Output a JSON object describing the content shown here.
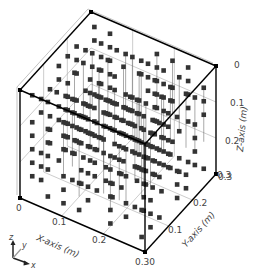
{
  "chart_data": {
    "type": "scatter",
    "projection": "3d",
    "title": "",
    "xlabel": "X-axis (m)",
    "ylabel": "Y-axis (m)",
    "zlabel": "Z-axis (m)",
    "xlim": [
      0,
      0.3
    ],
    "ylim": [
      0,
      0.3
    ],
    "zlim": [
      0,
      0.3
    ],
    "z_inverted": true,
    "x_ticks": [
      "0",
      "0.1",
      "0.2",
      "0.30"
    ],
    "y_ticks": [
      "0.1",
      "0.2",
      "0.3"
    ],
    "z_ticks": [
      "0",
      "0.1",
      "0.2",
      "0.3"
    ],
    "grid": true,
    "marker": "square",
    "marker_color": "#333333",
    "grid_spacing": 0.03
  },
  "triad": {
    "x": "x",
    "y": "y",
    "z": "z"
  },
  "colors": {
    "box_edge": "#000000",
    "grid_line": "#aaaaaa",
    "marker": "#333333",
    "text": "#444444"
  }
}
